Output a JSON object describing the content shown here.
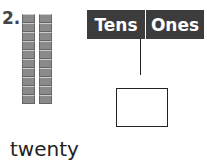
{
  "problem": {
    "number": "2.",
    "word": "twenty",
    "tens_rods": 2,
    "cubes_per_rod": 10
  },
  "place_value_chart": {
    "headers": [
      "Tens",
      "Ones"
    ],
    "answer_box_value": ""
  },
  "colors": {
    "header_bg": "#3c3c3c",
    "cube": "#8a8a8a"
  }
}
